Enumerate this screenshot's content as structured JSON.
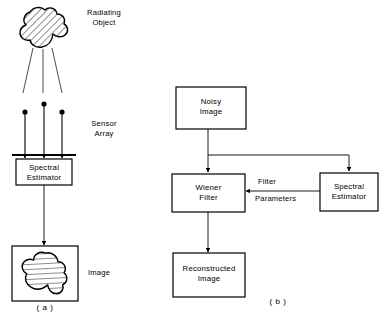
{
  "figure": {
    "type": "block-diagram",
    "panels": [
      {
        "id": "a",
        "caption": "( a )",
        "labels": {
          "radiating_object": "Radiating\nObject",
          "sensor_array": "Sensor\nArray",
          "image": "Image"
        },
        "blocks": [
          {
            "id": "spectral-estimator-a",
            "label": "Spectral\nEstimator"
          },
          {
            "id": "image-a",
            "label": ""
          }
        ],
        "sensor_count": 3
      },
      {
        "id": "b",
        "caption": "( b )",
        "blocks": [
          {
            "id": "noisy-image",
            "label": "Noisy\nImage"
          },
          {
            "id": "wiener-filter",
            "label": "Wiener\nFilter"
          },
          {
            "id": "spectral-estimator-b",
            "label": "Spectral\nEstimator"
          },
          {
            "id": "reconstructed-image",
            "label": "Reconstructed\nImage"
          }
        ],
        "edge_labels": {
          "filter": "Filter",
          "parameters": "Parameters"
        }
      }
    ],
    "colors": {
      "stroke": "#000000",
      "background": "#ffffff",
      "hatch": "#000000"
    }
  }
}
